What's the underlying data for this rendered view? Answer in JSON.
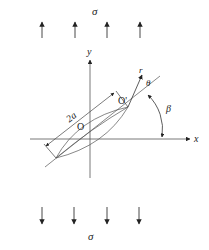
{
  "figure": {
    "labels": {
      "stress_top": "σ",
      "stress_bottom": "σ",
      "y_axis": "y",
      "x_axis": "x",
      "origin": "O",
      "crack_tip": "O'",
      "polar_r": "r",
      "polar_theta": "θ",
      "crack_angle": "β",
      "crack_length": "2a"
    },
    "colors": {
      "line": "#333333",
      "arrow": "#222222"
    },
    "top_arrows_x": [
      42,
      75,
      107,
      140
    ],
    "bottom_arrows_x": [
      42,
      74,
      107,
      139
    ]
  }
}
